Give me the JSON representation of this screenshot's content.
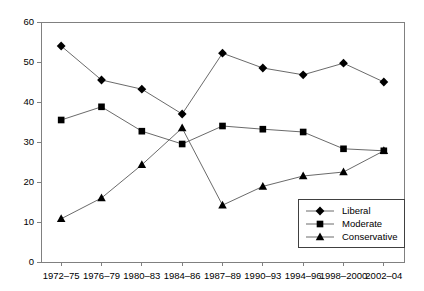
{
  "chart_data": {
    "type": "line",
    "title": "",
    "subtitle": "",
    "xlabel": "",
    "ylabel": "",
    "categories": [
      "1972–75",
      "1976–79",
      "1980–83",
      "1984–86",
      "1987–89",
      "1990–93",
      "1994–96",
      "1998–2000",
      "2002–04"
    ],
    "series": [
      {
        "name": "Liberal",
        "marker": "diamond",
        "values": [
          54.0,
          45.5,
          43.2,
          37.0,
          52.2,
          48.5,
          46.8,
          49.7,
          45.0
        ]
      },
      {
        "name": "Moderate",
        "marker": "square",
        "values": [
          35.5,
          38.8,
          32.7,
          29.5,
          34.0,
          33.2,
          32.5,
          28.3,
          27.8
        ]
      },
      {
        "name": "Conservative",
        "marker": "triangle",
        "values": [
          10.8,
          16.0,
          24.3,
          33.5,
          14.2,
          18.9,
          21.5,
          22.5,
          27.8
        ]
      }
    ],
    "ylim": [
      0,
      60
    ],
    "yticks": [
      0,
      10,
      20,
      30,
      40,
      50,
      60
    ],
    "ytick_labels": [
      "0",
      "10",
      "20",
      "30",
      "40",
      "50",
      "60"
    ],
    "grid": false,
    "legend_position": "bottom-right",
    "colors": {
      "marker": "#000000",
      "line": "#595959",
      "axis": "#808080",
      "text": "#000000",
      "background": "#ffffff"
    }
  },
  "legend": {
    "entries": [
      {
        "label": "Liberal"
      },
      {
        "label": "Moderate"
      },
      {
        "label": "Conservative"
      }
    ]
  }
}
